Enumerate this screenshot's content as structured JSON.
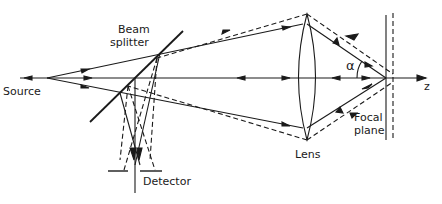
{
  "labels": {
    "source": "Source",
    "beam_splitter_line1": "Beam",
    "beam_splitter_line2": "splitter",
    "detector": "Detector",
    "lens": "Lens",
    "focal_plane_line1": "Focal",
    "focal_plane_line2": "plane",
    "alpha": "α",
    "axis": "z"
  },
  "colors": {
    "ink": "#1a1a1a",
    "background": "#ffffff"
  }
}
